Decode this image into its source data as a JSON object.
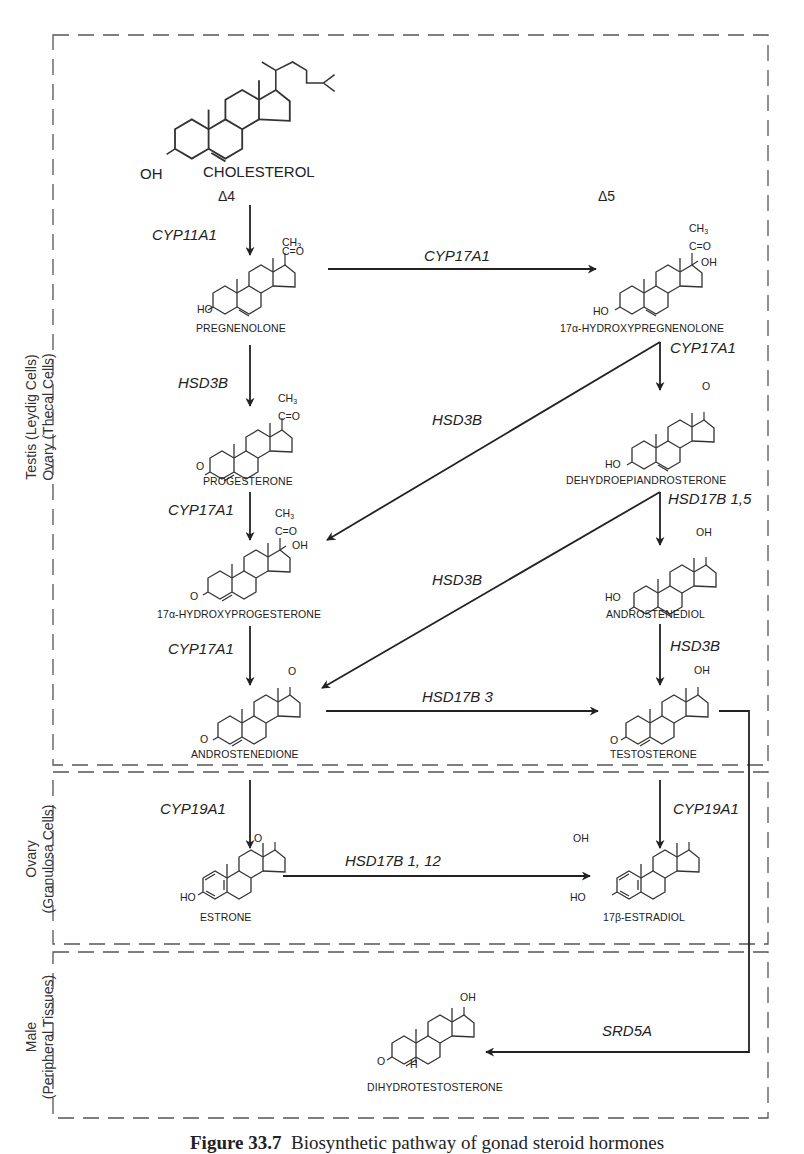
{
  "regions": [
    {
      "id": "testis_ovary_thecal",
      "label_line1": "Testis (Leydig Cells)",
      "label_line2": "Ovary (Thecal Cells)"
    },
    {
      "id": "ovary_granulosa",
      "label_line1": "Ovary",
      "label_line2": "(Granulosa Cells)"
    },
    {
      "id": "male_peripheral",
      "label_line1": "Male",
      "label_line2": "(Peripheral Tissues)"
    }
  ],
  "pathways": {
    "delta4": "Δ4",
    "delta5": "Δ5"
  },
  "compounds": {
    "cholesterol": {
      "name": "CHOLESTEROL",
      "group": "OH"
    },
    "pregnenolone": {
      "name": "PREGNENOLONE",
      "group": "HO",
      "side_chain_top": "CH3",
      "side_chain_mid": "C=O"
    },
    "hydroxypregnenolone": {
      "name": "17α-HYDROXYPREGNENOLONE",
      "group": "HO",
      "side_chain_top": "CH3",
      "side_chain_mid": "C=O",
      "oh": "OH"
    },
    "progesterone": {
      "name": "PROGESTERONE",
      "group": "O",
      "side_chain_top": "CH3",
      "side_chain_mid": "C=O"
    },
    "dhea": {
      "name": "DEHYDROEPIANDROSTERONE",
      "group": "HO",
      "keto": "O"
    },
    "hydroxyprogesterone": {
      "name": "17α-HYDROXYPROGESTERONE",
      "group": "O",
      "side_chain_top": "CH3",
      "side_chain_mid": "C=O",
      "oh": "OH"
    },
    "androstenediol": {
      "name": "ANDROSTENEDIOL",
      "group": "HO",
      "oh": "OH"
    },
    "androstenedione": {
      "name": "ANDROSTENEDIONE",
      "group": "O",
      "keto": "O"
    },
    "testosterone": {
      "name": "TESTOSTERONE",
      "group": "O",
      "oh": "OH"
    },
    "estrone": {
      "name": "ESTRONE",
      "group": "HO",
      "keto": "O"
    },
    "estradiol": {
      "name": "17β-ESTRADIOL",
      "group": "HO",
      "oh": "OH"
    },
    "dht": {
      "name": "DIHYDROTESTOSTERONE",
      "group": "O",
      "oh": "OH",
      "h": "H"
    }
  },
  "enzymes": {
    "chol_to_preg": "CYP11A1",
    "preg_to_ohpreg": "CYP17A1",
    "preg_to_prog": "HSD3B",
    "ohpreg_to_dhea": "CYP17A1",
    "ohpreg_to_ohprog": "HSD3B",
    "prog_to_ohprog": "CYP17A1",
    "dhea_to_adiol": "HSD17B 1,5",
    "dhea_to_adione": "HSD3B",
    "ohprog_to_adione": "CYP17A1",
    "adiol_to_testo": "HSD3B",
    "adione_to_testo": "HSD17B 3",
    "adione_to_estrone": "CYP19A1",
    "testo_to_estradiol": "CYP19A1",
    "estrone_to_estradiol": "HSD17B 1, 12",
    "testo_to_dht": "SRD5A"
  },
  "caption": {
    "figure": "Figure 33.7",
    "text": "Biosynthetic pathway of gonad steroid hormones"
  }
}
